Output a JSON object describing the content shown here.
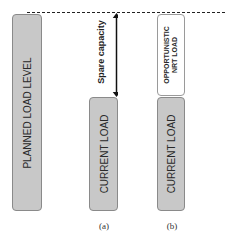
{
  "diagram": {
    "planned_bar": {
      "label": "PLANNED LOAD LEVEL",
      "color": "#c8c8c8"
    },
    "spare_capacity": {
      "label": "Spare capacity"
    },
    "panel_a": {
      "current_load": "CURRENT LOAD",
      "caption": "(a)"
    },
    "panel_b": {
      "opportunistic_line1": "OPPORTUNISTIC",
      "opportunistic_line2": "NRT LOAD",
      "current_load": "CURRENT LOAD",
      "caption": "(b)"
    },
    "colors": {
      "bar_fill": "#c8c8c8",
      "bar_border": "#8a8a8a",
      "opportunistic_fill": "#ffffff",
      "line": "#222222"
    }
  }
}
